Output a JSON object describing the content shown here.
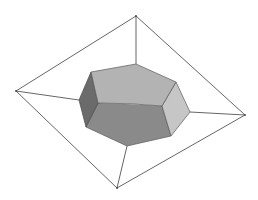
{
  "diagram": {
    "title": "Polyhedral ring inside a quadrilateral frame",
    "colors": {
      "background": "#ffffff",
      "edge": "#5a5a5a",
      "outline": "#555555",
      "face_top": "#b3b3b3",
      "face_left": "#6b6b6b",
      "face_right": "#c6c6c6",
      "face_bottom": "#8a8a8a"
    },
    "outer_vertices": {
      "top": [
        136,
        16
      ],
      "right": [
        245,
        115
      ],
      "bottom": [
        117,
        188
      ],
      "left": [
        16,
        91
      ]
    },
    "ring_vertices": {
      "a": [
        91,
        72
      ],
      "b": [
        136,
        64
      ],
      "c": [
        176,
        82
      ],
      "d": [
        162,
        106
      ],
      "e": [
        190,
        112
      ],
      "f": [
        171,
        136
      ],
      "g": [
        127,
        146
      ],
      "h": [
        86,
        127
      ],
      "i": [
        79,
        100
      ],
      "j": [
        98,
        103
      ]
    },
    "connector_edges": [
      {
        "from": "outer.top",
        "to": "ring.b"
      },
      {
        "from": "outer.left",
        "to": "ring.i"
      },
      {
        "from": "outer.right",
        "to": "ring.e"
      },
      {
        "from": "outer.bottom",
        "to": "ring.g"
      }
    ],
    "faces": [
      {
        "name": "top-face",
        "shade": "light"
      },
      {
        "name": "left-face",
        "shade": "dark"
      },
      {
        "name": "right-face",
        "shade": "lightest"
      },
      {
        "name": "bottom-face",
        "shade": "medium"
      }
    ]
  }
}
